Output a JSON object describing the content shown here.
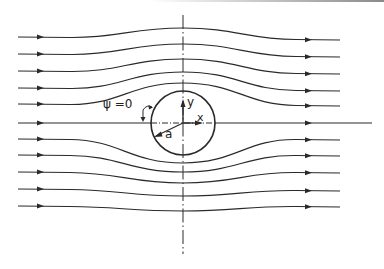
{
  "figure": {
    "labels": {
      "psi_label": "ψ =0",
      "y_axis": "y",
      "x_axis": "x",
      "radius": "a"
    },
    "colors": {
      "stroke": "#2a2a2a",
      "background": "#ffffff"
    },
    "cylinder": {
      "cx": 183,
      "cy": 123,
      "r": 32
    },
    "axes": {
      "horizontal": {
        "x1": 18,
        "x2": 372,
        "y": 123
      },
      "vertical": {
        "x": 183,
        "y1": 15,
        "y2": 254
      }
    },
    "streamlines": [
      {
        "id": "s1",
        "y_in": 37,
        "y_mid": 28,
        "y_out": 40
      },
      {
        "id": "s2",
        "y_in": 54,
        "y_mid": 44,
        "y_out": 57
      },
      {
        "id": "s3",
        "y_in": 71,
        "y_mid": 59,
        "y_out": 74
      },
      {
        "id": "s4",
        "y_in": 88,
        "y_mid": 72,
        "y_out": 91
      },
      {
        "id": "s5",
        "y_in": 104,
        "y_mid": 83,
        "y_out": 106
      },
      {
        "id": "s7",
        "y_in": 139,
        "y_mid": 163,
        "y_out": 140
      },
      {
        "id": "s8",
        "y_in": 155,
        "y_mid": 172,
        "y_out": 156
      },
      {
        "id": "s9",
        "y_in": 172,
        "y_mid": 183,
        "y_out": 173
      },
      {
        "id": "s10",
        "y_in": 189,
        "y_mid": 196,
        "y_out": 191
      },
      {
        "id": "s11",
        "y_in": 206,
        "y_mid": 211,
        "y_out": 207
      }
    ],
    "stagnation_streamline": {
      "label": "ψ = 0",
      "y": 123
    },
    "line_extent": {
      "x_start": 18,
      "x_end": 340,
      "arrow_left_x": 40,
      "arrow_right_x": 308
    }
  }
}
